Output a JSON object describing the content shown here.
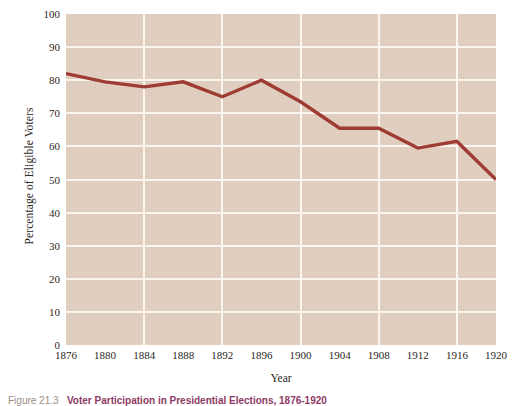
{
  "chart_data": {
    "type": "line",
    "title": "Voter Participation in Presidential Elections, 1876-1920",
    "xlabel": "Year",
    "ylabel": "Percentage of Eligible Voters",
    "x": [
      1876,
      1880,
      1884,
      1888,
      1892,
      1896,
      1900,
      1904,
      1908,
      1912,
      1916,
      1920
    ],
    "categories": [
      "1876",
      "1880",
      "1884",
      "1888",
      "1892",
      "1896",
      "1900",
      "1904",
      "1908",
      "1912",
      "1916",
      "1920"
    ],
    "values": [
      82,
      79.5,
      78,
      79.5,
      75,
      80,
      73.5,
      65.5,
      65.5,
      59.5,
      61.5,
      50
    ],
    "series": [
      {
        "name": "Percentage of Eligible Voters",
        "values": [
          82,
          79.5,
          78,
          79.5,
          75,
          80,
          73.5,
          65.5,
          65.5,
          59.5,
          61.5,
          50
        ],
        "color": "#9e3b32"
      }
    ],
    "xlim": [
      1876,
      1920
    ],
    "ylim": [
      0,
      100
    ],
    "yticks": [
      0,
      10,
      20,
      30,
      40,
      50,
      60,
      70,
      80,
      90,
      100
    ],
    "ytick_labels": [
      "0",
      "10",
      "20",
      "30",
      "40",
      "50",
      "60",
      "70",
      "80",
      "90",
      "100"
    ],
    "xtick_labels": [
      "1876",
      "1880",
      "1884",
      "1888",
      "1892",
      "1896",
      "1900",
      "1904",
      "1908",
      "1912",
      "1916",
      "1920"
    ],
    "vertical_gridline_years": [
      1884,
      1892,
      1900,
      1908,
      1916
    ],
    "grid": true,
    "legend": "none",
    "plot_background_color": "#e3d0c1",
    "gridline_color": "#fbf5ef",
    "line_color": "#9e3b32",
    "text_color": "#2b2724"
  },
  "caption": {
    "figure_number": "Figure 21.3",
    "title": "Voter Participation in Presidential Elections, 1876-1920",
    "fignum_color": "#9b8e86",
    "title_color": "#8e3a66"
  },
  "axes": {
    "x_title": "Year",
    "y_title": "Percentage of Eligible Voters"
  }
}
